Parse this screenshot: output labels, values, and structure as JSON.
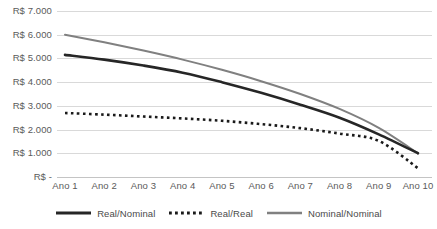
{
  "chart_data": {
    "type": "line",
    "title": "",
    "subtitle": "",
    "xlabel": "",
    "ylabel": "",
    "grid": true,
    "legend_position": "bottom",
    "ylim": [
      0,
      7000
    ],
    "categories": [
      "Ano 1",
      "Ano 2",
      "Ano 3",
      "Ano 4",
      "Ano 5",
      "Ano 6",
      "Ano 7",
      "Ano 8",
      "Ano 9",
      "Ano 10"
    ],
    "y_ticks": [
      {
        "value": 0,
        "label": "R$ -"
      },
      {
        "value": 1000,
        "label": "R$ 1.000"
      },
      {
        "value": 2000,
        "label": "R$ 2.000"
      },
      {
        "value": 3000,
        "label": "R$ 3.000"
      },
      {
        "value": 4000,
        "label": "R$ 4.000"
      },
      {
        "value": 5000,
        "label": "R$ 5.000"
      },
      {
        "value": 6000,
        "label": "R$ 6.000"
      },
      {
        "value": 7000,
        "label": "R$ 7.000"
      }
    ],
    "series": [
      {
        "name": "Real/Nominal",
        "style": "solid-thick",
        "color": "#262626",
        "values": [
          5150,
          4950,
          4700,
          4400,
          4000,
          3550,
          3050,
          2500,
          1800,
          1000
        ]
      },
      {
        "name": "Real/Real",
        "style": "dotted",
        "color": "#1a1a1a",
        "values": [
          2700,
          2630,
          2550,
          2470,
          2370,
          2230,
          2060,
          1830,
          1520,
          370
        ]
      },
      {
        "name": "Nominal/Nominal",
        "style": "solid",
        "color": "#808080",
        "values": [
          6000,
          5680,
          5330,
          4950,
          4520,
          4040,
          3500,
          2870,
          2070,
          1000
        ]
      }
    ]
  },
  "legend": {
    "entries": [
      {
        "label": "Real/Nominal"
      },
      {
        "label": "Real/Real"
      },
      {
        "label": "Nominal/Nominal"
      }
    ]
  }
}
